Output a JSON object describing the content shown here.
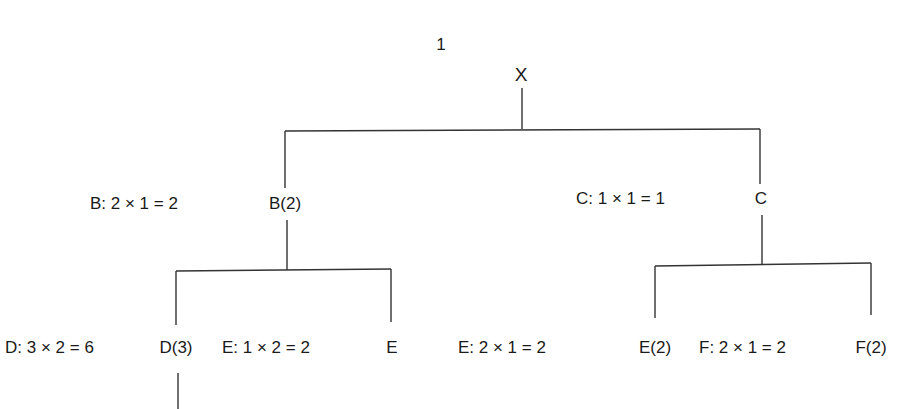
{
  "diagram": {
    "type": "tree",
    "page_label": "1",
    "root": {
      "label": "X"
    },
    "level1": [
      {
        "node": "B(2)",
        "calc": "B: 2 × 1 = 2"
      },
      {
        "node": "C",
        "calc": "C: 1 × 1 = 1"
      }
    ],
    "level2": [
      {
        "parent": "B",
        "node": "D(3)",
        "calc": "D: 3 × 2 = 6"
      },
      {
        "parent": "B",
        "node": "E",
        "calc": "E: 1 × 2 = 2"
      },
      {
        "parent": "C",
        "node": "E(2)",
        "calc": "E: 2 × 1 = 2"
      },
      {
        "parent": "C",
        "node": "F(2)",
        "calc": "F: 2 × 1 = 2"
      }
    ],
    "line_color": "#333333"
  }
}
